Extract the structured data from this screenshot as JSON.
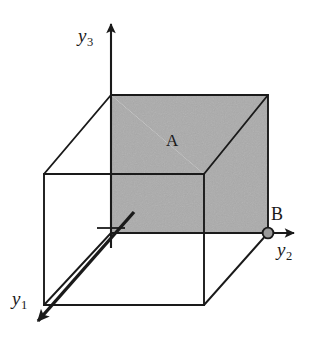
{
  "figure": {
    "background_color": "#ffffff",
    "line_color": "#1a1a1a",
    "shade_color": "#ababab",
    "point_fill_color": "#9a9a9a"
  },
  "axes": [
    {
      "id": "y1",
      "name": "y-one-axis",
      "label_text": "y",
      "label_sub": "1",
      "direction": "down-left",
      "origin": [
        111,
        233
      ],
      "tip": [
        33,
        326
      ]
    },
    {
      "id": "y2",
      "name": "y-two-axis",
      "label_text": "y",
      "label_sub": "2",
      "direction": "right",
      "origin": [
        111,
        233
      ],
      "tip": [
        299,
        233
      ]
    },
    {
      "id": "y3",
      "name": "y-three-axis",
      "label_text": "y",
      "label_sub": "3",
      "direction": "up",
      "origin": [
        111,
        233
      ],
      "tip": [
        111,
        18
      ]
    }
  ],
  "points": [
    {
      "id": "B",
      "name": "point-b",
      "label_text": "B",
      "position": [
        268,
        233
      ],
      "radius": 5.5
    }
  ],
  "regions": [
    {
      "id": "A",
      "name": "shaded-region-a",
      "label_text": "A",
      "label_position": [
        172,
        140
      ],
      "fill": "#ababab",
      "description": "Shaded top face and right face of the cube"
    }
  ],
  "cube": {
    "name": "cube-wireframe",
    "vertices": {
      "front_bottom_left": [
        44,
        305
      ],
      "front_top_left": [
        44,
        174
      ],
      "front_bottom_right": [
        204,
        305
      ],
      "front_top_right": [
        204,
        174
      ],
      "back_bottom_left": [
        111,
        233
      ],
      "back_top_left": [
        111,
        95
      ],
      "back_bottom_right": [
        268,
        233
      ],
      "back_top_right": [
        268,
        95
      ]
    },
    "origin_tick": {
      "name": "origin-tick-mark",
      "center": [
        111,
        233
      ]
    }
  }
}
